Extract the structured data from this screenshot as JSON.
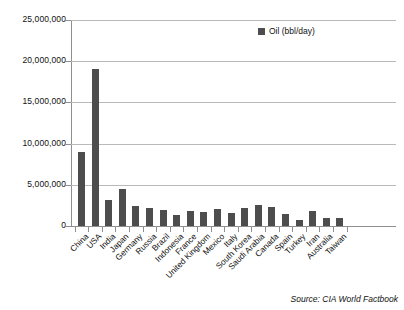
{
  "chart_data": {
    "type": "bar",
    "title": "",
    "subtitle": "",
    "xlabel": "",
    "ylabel": "",
    "ylim": [
      0,
      25000000
    ],
    "yticks": [
      0,
      5000000,
      10000000,
      15000000,
      20000000,
      25000000
    ],
    "ytick_labels": [
      "0",
      "5,000,000",
      "10,000,000",
      "15,000,000",
      "20,000,000",
      "25,000,000"
    ],
    "grid": true,
    "legend_position": "top-right",
    "legend": [
      "Oil (bbl/day)"
    ],
    "series_color": "#4d4d4d",
    "categories": [
      "China",
      "USA",
      "India",
      "Japan",
      "Germany",
      "Russia",
      "Brazil",
      "Indonesia",
      "France",
      "United Kingdom",
      "Mexico",
      "Italy",
      "South Korea",
      "Saudi Arabia",
      "Canada",
      "Spain",
      "Turkey",
      "Iran",
      "Australia",
      "Taiwan"
    ],
    "series": [
      {
        "name": "Oil (bbl/day)",
        "values": [
          9000000,
          19100000,
          3100000,
          4500000,
          2400000,
          2200000,
          2000000,
          1300000,
          1800000,
          1700000,
          2100000,
          1600000,
          2200000,
          2600000,
          2300000,
          1500000,
          700000,
          1800000,
          960000,
          950000
        ]
      }
    ],
    "annotations": [
      {
        "name": "source",
        "text": "Source: CIA World Factbook"
      }
    ]
  },
  "legend": {
    "label": "Oil (bbl/day)",
    "swatch_color": "#4d4d4d"
  },
  "footer": {
    "source": "Source: CIA World Factbook"
  }
}
